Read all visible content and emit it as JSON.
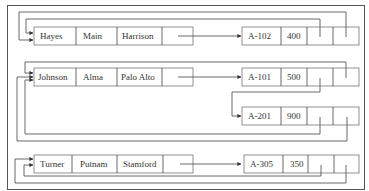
{
  "diagram": {
    "type": "multilist-file-structure",
    "customer_records": [
      {
        "name": "Hayes",
        "street": "Main",
        "city": "Harrison"
      },
      {
        "name": "Johnson",
        "street": "Alma",
        "city": "Palo Alto"
      },
      {
        "name": "Turner",
        "street": "Putnam",
        "city": "Stamford"
      }
    ],
    "account_records": [
      {
        "account": "A-102",
        "balance": "400"
      },
      {
        "account": "A-101",
        "balance": "500"
      },
      {
        "account": "A-201",
        "balance": "900"
      },
      {
        "account": "A-305",
        "balance": "350"
      }
    ],
    "links": [
      {
        "from": "Hayes",
        "to": "A-102"
      },
      {
        "from": "Johnson",
        "to": "A-101"
      },
      {
        "from": "A-101",
        "to": "A-201"
      },
      {
        "from": "Turner",
        "to": "A-305"
      },
      {
        "from": "A-102",
        "to": "Hayes"
      },
      {
        "from": "A-101",
        "to": "Johnson"
      },
      {
        "from": "A-201",
        "to": "Johnson"
      },
      {
        "from": "A-305",
        "to": "Turner"
      }
    ]
  }
}
